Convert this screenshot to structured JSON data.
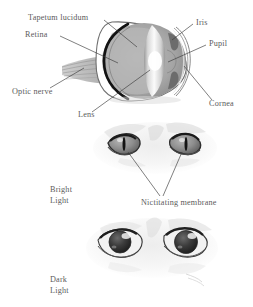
{
  "figure": {
    "panels": [
      {
        "id": "anatomy",
        "caption": ""
      },
      {
        "id": "bright",
        "caption": "Bright\nLight"
      },
      {
        "id": "dark",
        "caption": "Dark\nLight"
      }
    ]
  },
  "labels": {
    "tapetum_lucidum": "Tapetum lucidum",
    "retina": "Retina",
    "iris": "Iris",
    "pupil": "Pupil",
    "optic_nerve": "Optic nerve",
    "lens": "Lens",
    "cornea": "Cornea",
    "nictitating_membrane": "Nictitating membrane",
    "bright_line1": "Bright",
    "bright_line2": "Light",
    "dark_line1": "Dark",
    "dark_line2": "Light"
  },
  "colors": {
    "label_text": "#5b5b5b",
    "leader_line": "#3a3a3a",
    "sclera_outline": "#2b2b2b",
    "vitreous_gray": "#a9a9a9",
    "tapetum_gray": "#b9b9b9",
    "retina_dark": "#1c1c1c",
    "lens_light": "#efefef",
    "cornea_light": "#dcdcdc",
    "optic_nerve_gray": "#9e9e9e",
    "fur_gray": "#c9c9c9",
    "iris_gray": "#8d8d8d",
    "pupil_dark": "#151515",
    "background": "#ffffff"
  }
}
